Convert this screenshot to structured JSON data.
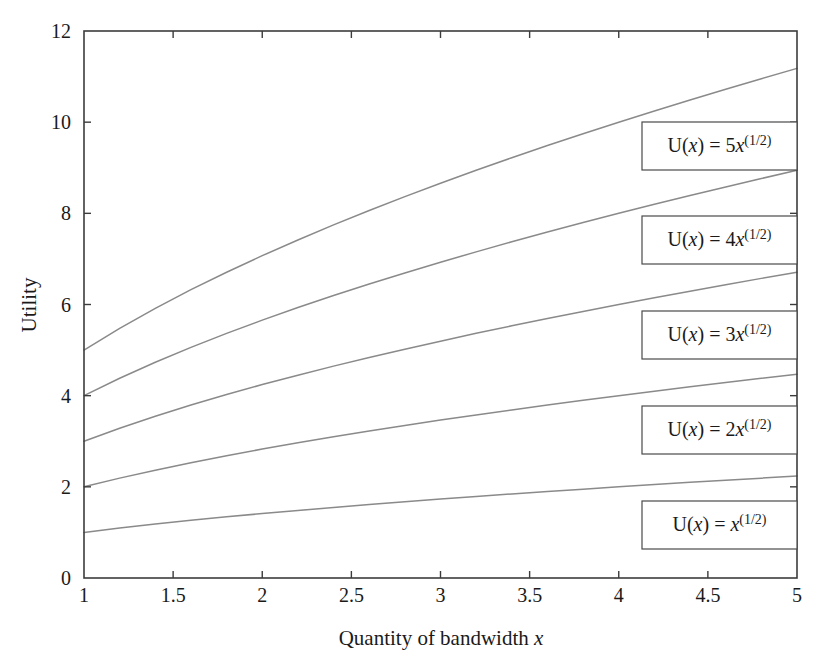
{
  "chart_data": {
    "type": "line",
    "title": "",
    "xlabel_parts": {
      "text": "Quantity of bandwidth ",
      "variable": "x"
    },
    "ylabel": "Utility",
    "xlim": [
      1,
      5
    ],
    "ylim": [
      0,
      12
    ],
    "xticks": [
      "1",
      "1.5",
      "2",
      "2.5",
      "3",
      "3.5",
      "4",
      "4.5",
      "5"
    ],
    "xtick_values": [
      1,
      1.5,
      2,
      2.5,
      3,
      3.5,
      4,
      4.5,
      5
    ],
    "yticks": [
      "0",
      "2",
      "4",
      "6",
      "8",
      "10",
      "12"
    ],
    "ytick_values": [
      0,
      2,
      4,
      6,
      8,
      10,
      12
    ],
    "grid": false,
    "legend_position": "inside-right-stacked",
    "line_color": "#8a8a8a",
    "axis_color": "#3c3c3c",
    "x": [
      1,
      1.2,
      1.4,
      1.6,
      1.8,
      2,
      2.2,
      2.4,
      2.6,
      2.8,
      3,
      3.2,
      3.4,
      3.6,
      3.8,
      4,
      4.2,
      4.4,
      4.6,
      4.8,
      5
    ],
    "series": [
      {
        "name": "U(x) = 5x^(1/2)",
        "coefficient": 5,
        "exponent": "1/2",
        "label_prefix": "U(",
        "label_var": "x",
        "label_mid": ") = ",
        "label_coef": "5",
        "label_base": "x",
        "label_exp": "(1/2)",
        "values": [
          5.0,
          5.477,
          5.916,
          6.325,
          6.708,
          7.071,
          7.416,
          7.746,
          8.062,
          8.367,
          8.66,
          8.944,
          9.22,
          9.487,
          9.747,
          10.0,
          10.247,
          10.488,
          10.724,
          10.954,
          11.18
        ]
      },
      {
        "name": "U(x) = 4x^(1/2)",
        "coefficient": 4,
        "exponent": "1/2",
        "label_prefix": "U(",
        "label_var": "x",
        "label_mid": ") = ",
        "label_coef": "4",
        "label_base": "x",
        "label_exp": "(1/2)",
        "values": [
          4.0,
          4.382,
          4.733,
          5.06,
          5.367,
          5.657,
          5.933,
          6.197,
          6.45,
          6.693,
          6.928,
          7.155,
          7.376,
          7.59,
          7.797,
          8.0,
          8.198,
          8.39,
          8.579,
          8.764,
          8.944
        ]
      },
      {
        "name": "U(x) = 3x^(1/2)",
        "coefficient": 3,
        "exponent": "1/2",
        "label_prefix": "U(",
        "label_var": "x",
        "label_mid": ") = ",
        "label_coef": "3",
        "label_base": "x",
        "label_exp": "(1/2)",
        "values": [
          3.0,
          3.286,
          3.55,
          3.795,
          4.025,
          4.243,
          4.45,
          4.648,
          4.837,
          5.02,
          5.196,
          5.367,
          5.532,
          5.692,
          5.848,
          6.0,
          6.148,
          6.293,
          6.434,
          6.573,
          6.708
        ]
      },
      {
        "name": "U(x) = 2x^(1/2)",
        "coefficient": 2,
        "exponent": "1/2",
        "label_prefix": "U(",
        "label_var": "x",
        "label_mid": ") = ",
        "label_coef": "2",
        "label_base": "x",
        "label_exp": "(1/2)",
        "values": [
          2.0,
          2.191,
          2.366,
          2.53,
          2.683,
          2.828,
          2.966,
          3.098,
          3.225,
          3.347,
          3.464,
          3.578,
          3.688,
          3.795,
          3.899,
          4.0,
          4.099,
          4.195,
          4.29,
          4.382,
          4.472
        ]
      },
      {
        "name": "U(x) = x^(1/2)",
        "coefficient": 1,
        "exponent": "1/2",
        "label_prefix": "U(",
        "label_var": "x",
        "label_mid": ") = ",
        "label_coef": "",
        "label_base": "x",
        "label_exp": "(1/2)",
        "values": [
          1.0,
          1.095,
          1.183,
          1.265,
          1.342,
          1.414,
          1.483,
          1.549,
          1.612,
          1.673,
          1.732,
          1.789,
          1.844,
          1.897,
          1.949,
          2.0,
          2.049,
          2.098,
          2.145,
          2.191,
          2.236
        ]
      }
    ],
    "legend_boxes": [
      {
        "series_index": 0,
        "top": 122,
        "height": 48,
        "right": 797,
        "width": 155
      },
      {
        "series_index": 1,
        "top": 216,
        "height": 48,
        "right": 797,
        "width": 155
      },
      {
        "series_index": 2,
        "top": 311,
        "height": 48,
        "right": 797,
        "width": 155
      },
      {
        "series_index": 3,
        "top": 406,
        "height": 48,
        "right": 797,
        "width": 155
      },
      {
        "series_index": 4,
        "top": 501,
        "height": 48,
        "right": 797,
        "width": 155
      }
    ]
  },
  "layout": {
    "plot_left": 84,
    "plot_top": 31,
    "plot_right": 797,
    "plot_bottom": 578,
    "tick_len": 7
  }
}
